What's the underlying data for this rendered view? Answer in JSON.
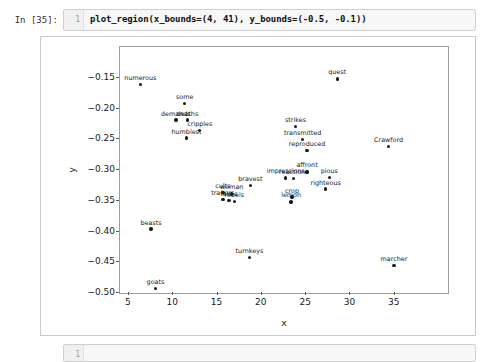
{
  "notebook": {
    "input_cell": {
      "prompt": "In [35]:",
      "line_number": "1",
      "code": "plot_region(x_bounds=(4, 41), y_bounds=(-0.5, -0.1))"
    },
    "next_cell": {
      "prompt": "",
      "line_number": "1",
      "code": ""
    }
  },
  "chart_data": {
    "type": "scatter",
    "title": "",
    "xlabel": "x",
    "ylabel": "y",
    "xlim": [
      4,
      41
    ],
    "ylim": [
      -0.5,
      -0.1
    ],
    "grid": false,
    "legend": false,
    "xticks": [
      5,
      10,
      15,
      20,
      25,
      30,
      35
    ],
    "xtick_labels": [
      "5",
      "10",
      "15",
      "20",
      "25",
      "30",
      "35"
    ],
    "yticks": [
      -0.15,
      -0.2,
      -0.25,
      -0.3,
      -0.35,
      -0.4,
      -0.45,
      -0.5
    ],
    "ytick_labels": [
      "−0.15",
      "−0.20",
      "−0.25",
      "−0.30",
      "−0.35",
      "−0.40",
      "−0.45",
      "−0.50"
    ],
    "marker_color": "#1a1a1a",
    "points": [
      {
        "label": "numerous",
        "x": 6.3,
        "y": -0.161
      },
      {
        "label": "some",
        "x": 11.3,
        "y": -0.192
      },
      {
        "label": "demands",
        "x": 10.3,
        "y": -0.219
      },
      {
        "label": "deaths",
        "x": 11.6,
        "y": -0.219
      },
      {
        "label": "cripples",
        "x": 13.0,
        "y": -0.236
      },
      {
        "label": "humblest",
        "x": 11.5,
        "y": -0.248
      },
      {
        "label": "beasts",
        "x": 7.5,
        "y": -0.396
      },
      {
        "label": "goats",
        "x": 8.0,
        "y": -0.493
      },
      {
        "label": "cults",
        "x": 15.6,
        "y": -0.337
      },
      {
        "label": "woman",
        "x": 16.6,
        "y": -0.339
      },
      {
        "label": "traitors",
        "x": 15.6,
        "y": -0.348
      },
      {
        "label": "fakes",
        "x": 16.3,
        "y": -0.35
      },
      {
        "label": "rebels",
        "x": 16.9,
        "y": -0.351
      },
      {
        "label": "bravest",
        "x": 18.7,
        "y": -0.325
      },
      {
        "label": "turnkeys",
        "x": 18.6,
        "y": -0.442
      },
      {
        "label": "impressions",
        "x": 22.7,
        "y": -0.313
      },
      {
        "label": "reactions",
        "x": 23.6,
        "y": -0.314
      },
      {
        "label": "affront",
        "x": 25.1,
        "y": -0.303
      },
      {
        "label": "crop",
        "x": 23.4,
        "y": -0.344
      },
      {
        "label": "lemon",
        "x": 23.3,
        "y": -0.352
      },
      {
        "label": "strikes",
        "x": 23.8,
        "y": -0.229
      },
      {
        "label": "transmitted",
        "x": 24.6,
        "y": -0.25
      },
      {
        "label": "reproduced",
        "x": 25.1,
        "y": -0.268
      },
      {
        "label": "pious",
        "x": 27.6,
        "y": -0.312
      },
      {
        "label": "righteous",
        "x": 27.2,
        "y": -0.331
      },
      {
        "label": "quest",
        "x": 28.5,
        "y": -0.152
      },
      {
        "label": "Crawford",
        "x": 34.3,
        "y": -0.262
      },
      {
        "label": "marcher",
        "x": 34.9,
        "y": -0.455
      }
    ]
  }
}
